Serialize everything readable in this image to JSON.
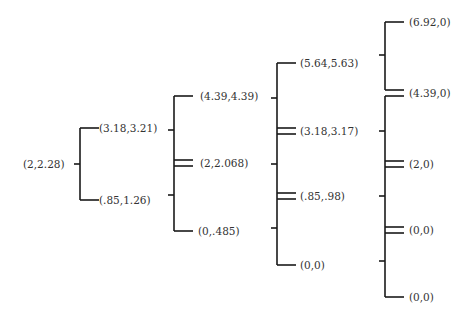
{
  "diagram": {
    "type": "tree-brackets",
    "line_color": "#1a1a1a",
    "text_color": "#333333",
    "levels": [
      {
        "nodes": [
          "(2,2.28)"
        ]
      },
      {
        "nodes": [
          "(3.18,3.21)",
          "(.85,1.26)"
        ]
      },
      {
        "nodes": [
          "(4.39,4.39)",
          "(2,2.068)",
          "(0,.485)"
        ]
      },
      {
        "nodes": [
          "(5.64,5.63)",
          "(3.18,3.17)",
          "(.85,.98)",
          "(0,0)"
        ]
      },
      {
        "nodes": [
          "(6.92,0)",
          "(4.39,0)",
          "(2,0)",
          "(0,0)",
          "(0,0)"
        ]
      }
    ]
  }
}
